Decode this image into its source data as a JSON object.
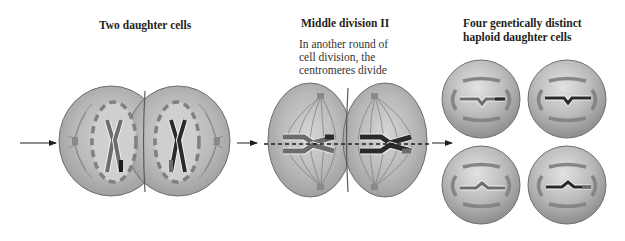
{
  "stages": [
    {
      "title": "Two daughter cells"
    },
    {
      "title": "Middle division II",
      "description": [
        "In another round of",
        "cell division, the",
        "centromeres divide"
      ]
    },
    {
      "title_lines": [
        "Four genetically distinct",
        "haploid daughter cells"
      ]
    }
  ],
  "colors": {
    "cell_fill": "#b4b4b4",
    "cell_edge": "#6e6e6e",
    "membrane": "#7a7a7a",
    "chromosome_light": "#6d6d6d",
    "chromosome_dark": "#2a2a2a",
    "arrow": "#231f20"
  },
  "arrows": [
    {
      "from_x": 20,
      "to_x": 58,
      "y": 143
    },
    {
      "from_x": 237,
      "to_x": 258,
      "y": 143
    },
    {
      "from_x": 432,
      "to_x": 452,
      "y": 143
    }
  ]
}
